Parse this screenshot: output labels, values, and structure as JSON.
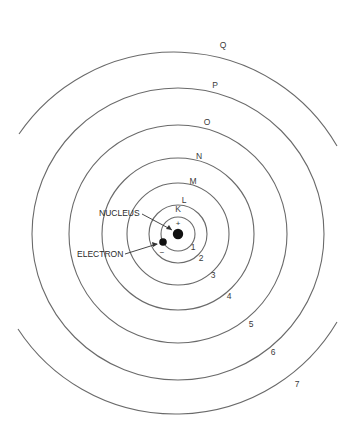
{
  "diagram": {
    "center": {
      "x": 178,
      "y": 234
    },
    "nucleus": {
      "label": "NUCLEUS",
      "charge": "+",
      "radius": 5
    },
    "electron": {
      "label": "ELECTRON",
      "charge": "−",
      "radius": 4
    },
    "shells": [
      {
        "letter": "K",
        "number": "1",
        "radius": 17
      },
      {
        "letter": "L",
        "number": "2",
        "radius": 29
      },
      {
        "letter": "M",
        "number": "3",
        "radius": 51
      },
      {
        "letter": "N",
        "number": "4",
        "radius": 76
      },
      {
        "letter": "O",
        "number": "5",
        "radius": 109
      },
      {
        "letter": "P",
        "number": "6",
        "radius": 146
      },
      {
        "letter": "Q",
        "number": "7",
        "radius": 188
      }
    ],
    "colors": {
      "line": "#6a6a6a",
      "text": "#2a2a2a",
      "background": "#ffffff"
    }
  }
}
